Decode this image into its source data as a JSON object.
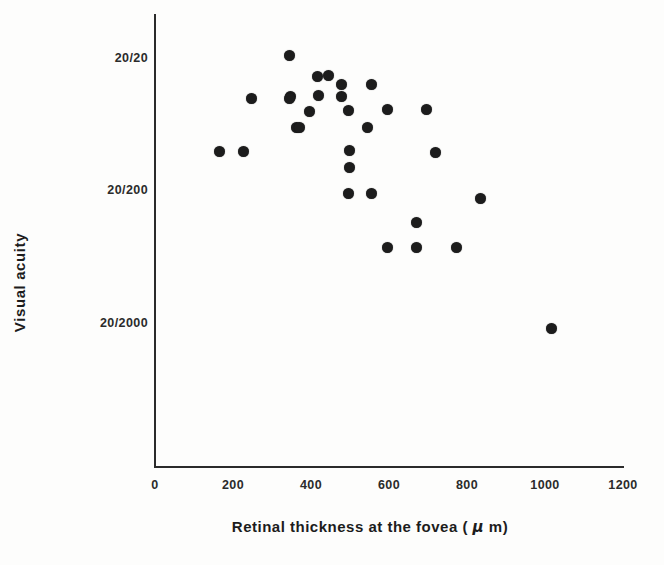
{
  "chart_data": {
    "type": "scatter",
    "title": "",
    "xlabel": "Retinal thickness at the fovea ( μ m)",
    "ylabel": "Visual acuity",
    "xlim": [
      0,
      1200
    ],
    "xticks": [
      0,
      200,
      400,
      600,
      800,
      1000,
      1200
    ],
    "xticklabels": [
      "0",
      "200",
      "400",
      "600",
      "800",
      "1000",
      "1200"
    ],
    "yscale": "log-reversed",
    "yticklabels": [
      "20/20",
      "20/200",
      "20/2000"
    ],
    "ytickvalues": [
      1.0,
      0.1,
      0.01
    ],
    "ylim_top_label": "20/20",
    "ylim_bottom_label": "20/2000",
    "grid": false,
    "legend": null,
    "marker": "filled-circle",
    "marker_color": "#1c1c1c",
    "n_points": 30,
    "points": [
      {
        "x": 344,
        "y_acuity": "20/26",
        "px": 289,
        "py": 55
      },
      {
        "x": 415,
        "y_acuity": "20/37",
        "px": 317,
        "py": 76
      },
      {
        "x": 443,
        "y_acuity": "20/36",
        "px": 328,
        "py": 75
      },
      {
        "x": 477,
        "y_acuity": "20/43",
        "px": 341,
        "py": 84
      },
      {
        "x": 554,
        "y_acuity": "20/43",
        "px": 371,
        "py": 84
      },
      {
        "x": 246,
        "y_acuity": "20/53",
        "px": 290,
        "py": 96
      },
      {
        "x": 418,
        "y_acuity": "20/52",
        "px": 318,
        "py": 95
      },
      {
        "x": 595,
        "y_acuity": "20/66",
        "px": 387,
        "py": 109
      },
      {
        "x": 695,
        "y_acuity": "20/66",
        "px": 426,
        "py": 109
      },
      {
        "x": 395,
        "y_acuity": "20/67",
        "px": 309,
        "py": 111
      },
      {
        "x": 495,
        "y_acuity": "20/66",
        "px": 348,
        "py": 110
      },
      {
        "x": 246,
        "y_acuity": "20/54",
        "px": 251,
        "py": 98
      },
      {
        "x": 344,
        "y_acuity": "20/54",
        "px": 289,
        "py": 98
      },
      {
        "x": 362,
        "y_acuity": "20/88",
        "px": 296,
        "py": 127
      },
      {
        "x": 544,
        "y_acuity": "20/88",
        "px": 367,
        "py": 127
      },
      {
        "x": 164,
        "y_acuity": "20/131",
        "px": 219,
        "py": 151
      },
      {
        "x": 226,
        "y_acuity": "20/131",
        "px": 243,
        "py": 151
      },
      {
        "x": 500,
        "y_acuity": "20/132",
        "px": 349,
        "py": 150
      },
      {
        "x": 718,
        "y_acuity": "20/133",
        "px": 435,
        "py": 152
      },
      {
        "x": 497,
        "y_acuity": "20/175",
        "px": 349,
        "py": 167
      },
      {
        "x": 495,
        "y_acuity": "20/203",
        "px": 348,
        "py": 193
      },
      {
        "x": 554,
        "y_acuity": "20/203",
        "px": 371,
        "py": 193
      },
      {
        "x": 833,
        "y_acuity": "20/216",
        "px": 480,
        "py": 198
      },
      {
        "x": 669,
        "y_acuity": "20/290",
        "px": 416,
        "py": 222
      },
      {
        "x": 595,
        "y_acuity": "20/400",
        "px": 387,
        "py": 247
      },
      {
        "x": 669,
        "y_acuity": "20/400",
        "px": 416,
        "py": 247
      },
      {
        "x": 772,
        "y_acuity": "20/400",
        "px": 456,
        "py": 247
      },
      {
        "x": 359,
        "y_acuity": "20/68",
        "px": 299,
        "py": 127
      },
      {
        "x": 479,
        "y_acuity": "20/52",
        "px": 341,
        "py": 96
      },
      {
        "x": 1015,
        "y_acuity": "20/1900",
        "px": 551,
        "py": 328
      }
    ]
  },
  "axes": {
    "y_ticks": [
      {
        "label": "20/20",
        "py": 58
      },
      {
        "label": "20/200",
        "py": 190
      },
      {
        "label": "20/2000",
        "py": 323
      }
    ],
    "x_ticks": [
      {
        "label": "0",
        "px": 155
      },
      {
        "label": "200",
        "px": 233
      },
      {
        "label": "400",
        "px": 311
      },
      {
        "label": "600",
        "px": 389
      },
      {
        "label": "800",
        "px": 467
      },
      {
        "label": "1000",
        "px": 545
      },
      {
        "label": "1200",
        "px": 623
      }
    ]
  }
}
